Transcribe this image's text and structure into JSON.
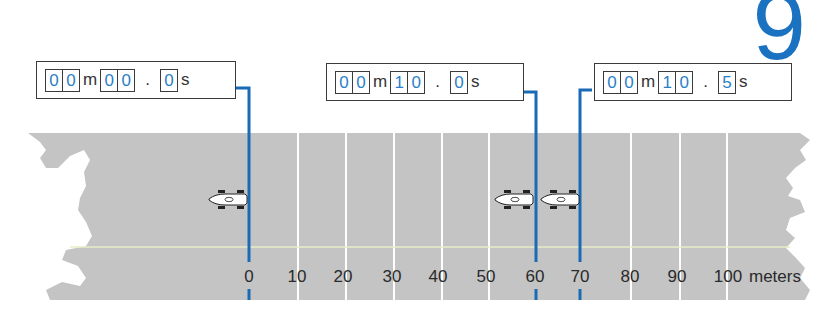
{
  "figure": {
    "number": "9"
  },
  "timers": [
    {
      "label": "timer-start",
      "minutes": [
        "0",
        "0"
      ],
      "min_unit": "m",
      "seconds": [
        "0",
        "0"
      ],
      "separator": ".",
      "tenths": [
        "0"
      ],
      "sec_unit": "s",
      "marker_distance": 0
    },
    {
      "label": "timer-mid",
      "minutes": [
        "0",
        "0"
      ],
      "min_unit": "m",
      "seconds": [
        "1",
        "0"
      ],
      "separator": ".",
      "tenths": [
        "0"
      ],
      "sec_unit": "s",
      "marker_distance": 60
    },
    {
      "label": "timer-end",
      "minutes": [
        "0",
        "0"
      ],
      "min_unit": "m",
      "seconds": [
        "1",
        "0"
      ],
      "separator": ".",
      "tenths": [
        "5"
      ],
      "sec_unit": "s",
      "marker_distance": 70
    }
  ],
  "axis": {
    "ticks": [
      "0",
      "10",
      "20",
      "30",
      "40",
      "50",
      "60",
      "70",
      "80",
      "90",
      "100"
    ],
    "unit": "meters"
  },
  "cars": [
    {
      "position_m": -1,
      "time": "00m 00.0s"
    },
    {
      "position_m": 58,
      "time": "00m 10.0s"
    },
    {
      "position_m": 67,
      "time": "00m 10.5s"
    }
  ],
  "colors": {
    "accent": "#1a6bb5",
    "track": "#c4c4c4",
    "gridline": "#ffffff",
    "centerline": "#e8ecc8",
    "digit": "#2b7fc8"
  }
}
